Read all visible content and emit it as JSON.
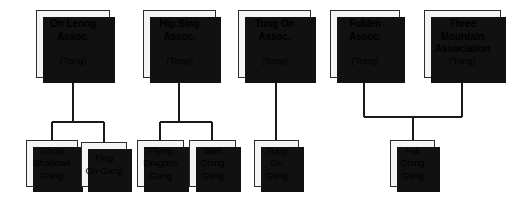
{
  "diagram": {
    "type": "organizational-hierarchy",
    "background_color": "#ffffff",
    "box_fill_color": "#f4f4f2",
    "box_border_color": "#2b2b2b",
    "shadow_color": "#111111",
    "line_color": "#1a1a1a",
    "tongs": [
      {
        "id": "on-leong",
        "title": "On Leong\nAssoc.",
        "title_lines": [
          "On Leong",
          "Assoc."
        ],
        "subtitle": "(Tong)",
        "x": 36,
        "y": 10,
        "w": 74,
        "h": 68,
        "children": [
          "ghost-shadows",
          "ping-on"
        ]
      },
      {
        "id": "hip-sing",
        "title": "Hip Sing\nAssoc.",
        "title_lines": [
          "Hip Sing",
          "Assoc."
        ],
        "subtitle": "(Tong)",
        "x": 143,
        "y": 10,
        "w": 73,
        "h": 68,
        "children": [
          "flying-dragons",
          "wah-ching"
        ]
      },
      {
        "id": "tung-on",
        "title": "Tung On\nAssoc.",
        "title_lines": [
          "Tung On",
          "Assoc."
        ],
        "subtitle": "(Tong)",
        "x": 238,
        "y": 10,
        "w": 73,
        "h": 68,
        "children": [
          "tung-on-gang"
        ]
      },
      {
        "id": "fuklen",
        "title": "Fuklen\nAssoc.",
        "title_lines": [
          "Fuklen",
          "Assoc."
        ],
        "subtitle": "(Tong)",
        "x": 330,
        "y": 10,
        "w": 70,
        "h": 68,
        "children": [
          "fuk-ching"
        ]
      },
      {
        "id": "three-mountain",
        "title": "Three\nMountain\nAssociation",
        "title_lines": [
          "Three",
          "Mountain",
          "Association"
        ],
        "subtitle": "(Tong)",
        "x": 424,
        "y": 10,
        "w": 77,
        "h": 68,
        "children": [
          "fuk-ching"
        ]
      }
    ],
    "gangs": [
      {
        "id": "ghost-shadows",
        "title": "Ghost\nShadows\nGang",
        "title_lines": [
          "Ghost",
          "Shadows",
          "Gang"
        ],
        "x": 26,
        "y": 140,
        "w": 52,
        "h": 47,
        "parent": "on-leong"
      },
      {
        "id": "ping-on",
        "title": "Ping\nOn Gang",
        "title_lines": [
          "Ping",
          "On Gang"
        ],
        "x": 81,
        "y": 142,
        "w": 46,
        "h": 45,
        "parent": "on-leong"
      },
      {
        "id": "flying-dragons",
        "title": "Flying\nDragons\nGang",
        "title_lines": [
          "Flying",
          "Dragons",
          "Gang"
        ],
        "x": 137,
        "y": 140,
        "w": 47,
        "h": 47,
        "parent": "hip-sing"
      },
      {
        "id": "wah-ching",
        "title": "Wah\nChing\nGang",
        "title_lines": [
          "Wah",
          "Ching",
          "Gang"
        ],
        "x": 189,
        "y": 140,
        "w": 47,
        "h": 47,
        "parent": "hip-sing"
      },
      {
        "id": "tung-on-gang",
        "title": "Tung\nOn\nGang",
        "title_lines": [
          "Tung",
          "On",
          "Gang"
        ],
        "x": 254,
        "y": 140,
        "w": 45,
        "h": 47,
        "parent": "tung-on"
      },
      {
        "id": "fuk-ching",
        "title": "Fuk\nChing\nGang",
        "title_lines": [
          "Fuk",
          "Ching",
          "Gang"
        ],
        "x": 390,
        "y": 140,
        "w": 45,
        "h": 47,
        "parents": [
          "fuklen",
          "three-mountain"
        ]
      }
    ],
    "connectors": [
      {
        "name": "on-leong-stem",
        "x1": 73,
        "y1": 78,
        "x2": 73,
        "y2": 122
      },
      {
        "name": "on-leong-bridge",
        "x1": 52,
        "y1": 122,
        "x2": 104,
        "y2": 122
      },
      {
        "name": "ghost-shadows-drop",
        "x1": 52,
        "y1": 122,
        "x2": 52,
        "y2": 140
      },
      {
        "name": "ping-on-drop",
        "x1": 104,
        "y1": 122,
        "x2": 104,
        "y2": 142
      },
      {
        "name": "hip-sing-stem",
        "x1": 179,
        "y1": 78,
        "x2": 179,
        "y2": 122
      },
      {
        "name": "hip-sing-bridge",
        "x1": 160,
        "y1": 122,
        "x2": 212,
        "y2": 122
      },
      {
        "name": "flying-dragons-drop",
        "x1": 160,
        "y1": 122,
        "x2": 160,
        "y2": 140
      },
      {
        "name": "wah-ching-drop",
        "x1": 212,
        "y1": 122,
        "x2": 212,
        "y2": 140
      },
      {
        "name": "tung-on-stem",
        "x1": 276,
        "y1": 78,
        "x2": 276,
        "y2": 140
      },
      {
        "name": "fuklen-drop",
        "x1": 364,
        "y1": 78,
        "x2": 364,
        "y2": 117
      },
      {
        "name": "three-mountain-drop",
        "x1": 462,
        "y1": 78,
        "x2": 462,
        "y2": 117
      },
      {
        "name": "fuk-ching-bridge",
        "x1": 364,
        "y1": 117,
        "x2": 462,
        "y2": 117
      },
      {
        "name": "fuk-ching-stem",
        "x1": 413,
        "y1": 117,
        "x2": 413,
        "y2": 140
      }
    ]
  }
}
